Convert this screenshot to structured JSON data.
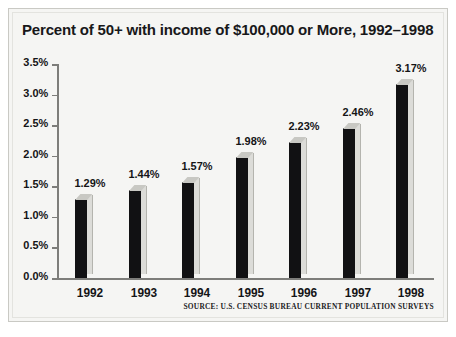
{
  "chart_data": {
    "type": "bar",
    "title": "Percent of 50+ with income of $100,000 or More, 1992–1998",
    "categories": [
      "1992",
      "1993",
      "1994",
      "1995",
      "1996",
      "1997",
      "1998"
    ],
    "values": [
      1.29,
      1.44,
      1.57,
      1.98,
      2.23,
      2.46,
      3.17
    ],
    "value_labels": [
      "1.29%",
      "1.44%",
      "1.57%",
      "1.98%",
      "2.23%",
      "2.46%",
      "3.17%"
    ],
    "xlabel": "",
    "ylabel": "",
    "ylim": [
      0.0,
      3.5
    ],
    "ytick_values": [
      0.0,
      0.5,
      1.0,
      1.5,
      2.0,
      2.5,
      3.0,
      3.5
    ],
    "ytick_labels": [
      "0.0%",
      "0.5%",
      "1.0%",
      "1.5%",
      "2.0%",
      "2.5%",
      "3.0%",
      "3.5%"
    ],
    "grid": false,
    "legend": null,
    "series": [
      {
        "name": "Percent of 50+ with income of $100,000 or More",
        "values": [
          1.29,
          1.44,
          1.57,
          1.98,
          2.23,
          2.46,
          3.17
        ]
      }
    ],
    "bar_style": "3d-column",
    "colors": {
      "bar_front": "#111113",
      "bar_side": "#dcdcd8",
      "bar_top": "#c8c8c3",
      "axis": "#7d7d7a",
      "text": "#141416",
      "background": "#f5f5f3",
      "frame": "#c9c9c4"
    }
  },
  "source_note": "SOURCE: U.S. CENSUS BUREAU CURRENT POPULATION SURVEYS"
}
